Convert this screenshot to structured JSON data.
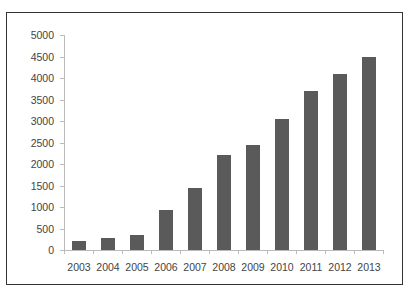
{
  "chart_data": {
    "type": "bar",
    "title": "",
    "xlabel": "",
    "ylabel": "",
    "categories": [
      "2003",
      "2004",
      "2005",
      "2006",
      "2007",
      "2008",
      "2009",
      "2010",
      "2011",
      "2012",
      "2013"
    ],
    "values": [
      220,
      280,
      340,
      920,
      1440,
      2200,
      2450,
      3040,
      3700,
      4100,
      4500
    ],
    "ylim": [
      0,
      5000
    ],
    "yticks": [
      "0",
      "500",
      "1000",
      "1500",
      "2000",
      "2500",
      "3000",
      "3500",
      "4000",
      "4500",
      "5000"
    ],
    "grid": false,
    "legend": null,
    "bar_color": "#5a5a5a"
  }
}
